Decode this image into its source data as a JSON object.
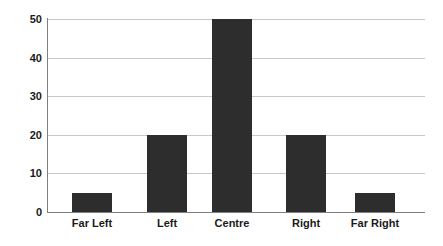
{
  "chart_data": {
    "type": "bar",
    "title": "",
    "subtitle": "",
    "xlabel": "",
    "ylabel": "",
    "categories": [
      "Far Left",
      "Left",
      "Centre",
      "Right",
      "Far Right"
    ],
    "values": [
      5,
      20,
      50,
      20,
      5
    ],
    "ylim": [
      0,
      50
    ],
    "yticks": [
      0,
      10,
      20,
      30,
      40,
      50
    ],
    "ytick_labels": [
      "0",
      "10",
      "20",
      "30",
      "40",
      "50"
    ],
    "grid": true,
    "grid_axis": "y",
    "legend": false,
    "legend_position": "none",
    "annotations": []
  },
  "style": {
    "bar_color": "#2d2d2d",
    "grid_color": "#c8c8c8",
    "axis_color": "#808080",
    "background_color": "#ffffff",
    "text_color": "#1a1a1a"
  }
}
